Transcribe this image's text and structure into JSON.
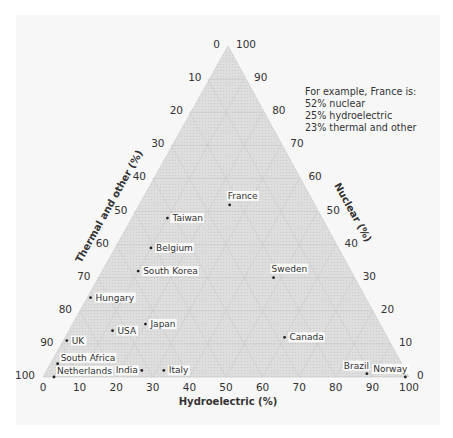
{
  "chart_data": {
    "type": "scatter",
    "subtype": "ternary",
    "title": "",
    "axes": {
      "bottom": {
        "label": "Hydroelectric (%)",
        "ticks": [
          "0",
          "10",
          "20",
          "30",
          "40",
          "50",
          "60",
          "70",
          "80",
          "90",
          "100"
        ]
      },
      "left": {
        "label": "Thermal and other (%)",
        "ticks": [
          "0",
          "10",
          "20",
          "30",
          "40",
          "50",
          "60",
          "70",
          "80",
          "90",
          "100"
        ]
      },
      "right": {
        "label": "Nuclear (%)",
        "ticks": [
          "100",
          "90",
          "80",
          "70",
          "60",
          "50",
          "40",
          "30",
          "20",
          "10",
          "0"
        ]
      }
    },
    "range": [
      0,
      100
    ],
    "grid": true,
    "annotation": {
      "lines": [
        "For example, France is:",
        "52% nuclear",
        "25% hydroelectric",
        "23% thermal and other"
      ]
    },
    "points": [
      {
        "name": "France",
        "nuclear": 52,
        "hydro": 25,
        "thermal": 23,
        "label_pos": "above"
      },
      {
        "name": "Taiwan",
        "nuclear": 48,
        "hydro": 10,
        "thermal": 42,
        "label_pos": "right"
      },
      {
        "name": "Belgium",
        "nuclear": 39,
        "hydro": 10,
        "thermal": 51,
        "label_pos": "right"
      },
      {
        "name": "South Korea",
        "nuclear": 32,
        "hydro": 10,
        "thermal": 58,
        "label_pos": "right"
      },
      {
        "name": "Sweden",
        "nuclear": 30,
        "hydro": 48,
        "thermal": 22,
        "label_pos": "above"
      },
      {
        "name": "Hungary",
        "nuclear": 24,
        "hydro": 1,
        "thermal": 75,
        "label_pos": "right"
      },
      {
        "name": "Japan",
        "nuclear": 16,
        "hydro": 20,
        "thermal": 64,
        "label_pos": "right"
      },
      {
        "name": "USA",
        "nuclear": 14,
        "hydro": 12,
        "thermal": 74,
        "label_pos": "right"
      },
      {
        "name": "UK",
        "nuclear": 11,
        "hydro": 1,
        "thermal": 88,
        "label_pos": "right"
      },
      {
        "name": "Canada",
        "nuclear": 12,
        "hydro": 60,
        "thermal": 28,
        "label_pos": "right"
      },
      {
        "name": "South Africa",
        "nuclear": 4,
        "hydro": 2,
        "thermal": 94,
        "label_pos": "right-up"
      },
      {
        "name": "Netherlands",
        "nuclear": 0,
        "hydro": 3,
        "thermal": 97,
        "label_pos": "right-up"
      },
      {
        "name": "India",
        "nuclear": 2,
        "hydro": 26,
        "thermal": 72,
        "label_pos": "left"
      },
      {
        "name": "Italy",
        "nuclear": 2,
        "hydro": 32,
        "thermal": 66,
        "label_pos": "right"
      },
      {
        "name": "Brazil",
        "nuclear": 1,
        "hydro": 88,
        "thermal": 11,
        "label_pos": "above-left"
      },
      {
        "name": "Norway",
        "nuclear": 0,
        "hydro": 99,
        "thermal": 1,
        "label_pos": "above-left"
      }
    ]
  }
}
